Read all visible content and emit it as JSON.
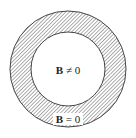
{
  "diagram": {
    "outer_region_label": "B = 0",
    "inner_region_label": "B ≠ 0",
    "labels": {
      "inner_symbol": "B",
      "inner_relation": "≠",
      "inner_value": "0",
      "outer_symbol": "B",
      "outer_relation": "=",
      "outer_value": "0"
    },
    "colors": {
      "hatch": "#666666",
      "stroke": "#444444",
      "background": "#ffffff"
    }
  }
}
